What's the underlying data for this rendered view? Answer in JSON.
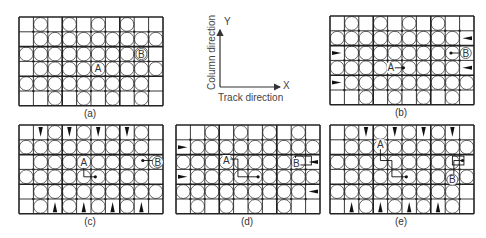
{
  "figure": {
    "panels": [
      {
        "id": "a",
        "label": "(a)",
        "x": 18,
        "y": 16,
        "labelY": 108,
        "grid": [
          [
            "E",
            "C",
            "E",
            "C",
            "E",
            "C",
            "E",
            "C",
            "E",
            "E"
          ],
          [
            "E",
            "C",
            "C",
            "C",
            "C",
            "C",
            "C",
            "C",
            "C",
            "C"
          ],
          [
            "C",
            "C",
            "C",
            "C",
            "C",
            "C",
            "C",
            "C",
            "C",
            "E"
          ],
          [
            "E",
            "C",
            "C",
            "C",
            "C",
            "C",
            "C",
            "C",
            "C",
            "C"
          ],
          [
            "C",
            "C",
            "C",
            "C",
            "C",
            "C",
            "C",
            "C",
            "C",
            "E"
          ],
          [
            "E",
            "E",
            "C",
            "E",
            "C",
            "E",
            "C",
            "E",
            "C",
            "E"
          ]
        ],
        "markers": [
          {
            "text": "A",
            "row": 3,
            "col": 5,
            "dx": 0,
            "dy": 0,
            "circled": false
          },
          {
            "text": "B",
            "row": 2,
            "col": 8,
            "dx": 0,
            "dy": 0,
            "circled": true
          }
        ],
        "paths": []
      },
      {
        "id": "b",
        "label": "(b)",
        "x": 329,
        "y": 15,
        "labelY": 107,
        "grid": [
          [
            "E",
            "C",
            "E",
            "C",
            "E",
            "C",
            "E",
            "C",
            "E",
            "E"
          ],
          [
            "C",
            "C",
            "C",
            "C",
            "C",
            "C",
            "C",
            "C",
            "C",
            "L"
          ],
          [
            "R",
            "C",
            "C",
            "C",
            "C",
            "C",
            "C",
            "C",
            "C",
            "E"
          ],
          [
            "C",
            "C",
            "C",
            "C",
            "C",
            "C",
            "C",
            "C",
            "C",
            "L"
          ],
          [
            "R",
            "C",
            "C",
            "C",
            "C",
            "C",
            "C",
            "C",
            "C",
            "C"
          ],
          [
            "E",
            "E",
            "C",
            "E",
            "C",
            "E",
            "C",
            "E",
            "C",
            "E"
          ]
        ],
        "markers": [
          {
            "text": "A",
            "row": 3,
            "col": 4,
            "dx": -4,
            "dy": 0,
            "circled": false
          },
          {
            "text": "B",
            "row": 2,
            "col": 9,
            "dx": -1,
            "dy": 0,
            "circled": true
          }
        ],
        "paths": [
          {
            "points": [
              [
                4.4,
                3.5
              ],
              [
                5.1,
                3.5
              ]
            ],
            "dot": true
          },
          {
            "points": [
              [
                8.4,
                2.5
              ],
              [
                9.0,
                2.5
              ]
            ],
            "dot": "start"
          }
        ]
      },
      {
        "id": "c",
        "label": "(c)",
        "x": 18,
        "y": 124,
        "labelY": 216,
        "grid": [
          [
            "E",
            "D",
            "C",
            "D",
            "C",
            "D",
            "C",
            "D",
            "C",
            "E"
          ],
          [
            "C",
            "C",
            "C",
            "C",
            "C",
            "C",
            "C",
            "C",
            "C",
            "E"
          ],
          [
            "E",
            "C",
            "C",
            "C",
            "C",
            "C",
            "C",
            "C",
            "C",
            "C"
          ],
          [
            "C",
            "C",
            "C",
            "C",
            "C",
            "C",
            "C",
            "C",
            "C",
            "E"
          ],
          [
            "E",
            "C",
            "C",
            "C",
            "C",
            "C",
            "C",
            "C",
            "C",
            "C"
          ],
          [
            "E",
            "C",
            "U",
            "C",
            "U",
            "C",
            "U",
            "C",
            "U",
            "E"
          ]
        ],
        "markers": [
          {
            "text": "A",
            "row": 2,
            "col": 4,
            "dx": 0,
            "dy": 0,
            "circled": false
          },
          {
            "text": "B",
            "row": 2,
            "col": 9,
            "dx": 2,
            "dy": 0,
            "circled": true
          }
        ],
        "paths": [
          {
            "points": [
              [
                4.5,
                2.9
              ],
              [
                4.5,
                3.5
              ],
              [
                5.3,
                3.5
              ]
            ],
            "dot": true
          },
          {
            "points": [
              [
                8.6,
                2.4
              ],
              [
                9.3,
                2.4
              ]
            ],
            "dot": "start"
          }
        ]
      },
      {
        "id": "d",
        "label": "(d)",
        "x": 175,
        "y": 124,
        "labelY": 216,
        "grid": [
          [
            "E",
            "E",
            "C",
            "E",
            "C",
            "E",
            "C",
            "E",
            "C",
            "E"
          ],
          [
            "R",
            "C",
            "C",
            "C",
            "C",
            "C",
            "C",
            "C",
            "C",
            "C"
          ],
          [
            "C",
            "C",
            "C",
            "C",
            "C",
            "C",
            "C",
            "C",
            "C",
            "L"
          ],
          [
            "R",
            "C",
            "C",
            "C",
            "C",
            "C",
            "C",
            "C",
            "C",
            "C"
          ],
          [
            "C",
            "C",
            "C",
            "C",
            "C",
            "C",
            "C",
            "C",
            "C",
            "L"
          ],
          [
            "E",
            "C",
            "E",
            "C",
            "E",
            "C",
            "E",
            "C",
            "E",
            "E"
          ]
        ],
        "markers": [
          {
            "text": "A",
            "row": 2,
            "col": 3,
            "dx": 0,
            "dy": -2,
            "circled": false
          },
          {
            "text": "B",
            "row": 2,
            "col": 8,
            "dx": -2,
            "dy": 1,
            "circled": false
          }
        ],
        "paths": [
          {
            "points": [
              [
                3.4,
                2.3
              ],
              [
                4.3,
                2.3
              ],
              [
                4.3,
                3.5
              ],
              [
                5.7,
                3.5
              ]
            ],
            "dot": true
          }
        ],
        "boxes": [
          {
            "row": 2,
            "col": 8,
            "w": 1.1,
            "h": 0.6,
            "dx": 0.3,
            "dy": 0.1
          }
        ]
      },
      {
        "id": "e",
        "label": "(e)",
        "x": 329,
        "y": 124,
        "labelY": 216,
        "grid": [
          [
            "E",
            "C",
            "D",
            "C",
            "D",
            "C",
            "D",
            "C",
            "D",
            "E"
          ],
          [
            "E",
            "C",
            "C",
            "C",
            "C",
            "C",
            "C",
            "C",
            "C",
            "C"
          ],
          [
            "C",
            "C",
            "C",
            "C",
            "C",
            "C",
            "C",
            "C",
            "C",
            "E"
          ],
          [
            "E",
            "C",
            "C",
            "C",
            "C",
            "C",
            "C",
            "C",
            "C",
            "C"
          ],
          [
            "C",
            "C",
            "C",
            "C",
            "C",
            "C",
            "C",
            "C",
            "C",
            "E"
          ],
          [
            "E",
            "U",
            "C",
            "U",
            "C",
            "U",
            "C",
            "U",
            "C",
            "E"
          ]
        ],
        "markers": [
          {
            "text": "A",
            "row": 1,
            "col": 3,
            "dx": 0,
            "dy": -3,
            "circled": false
          },
          {
            "text": "B",
            "row": 3,
            "col": 8,
            "dx": 0,
            "dy": 3,
            "circled": true
          }
        ],
        "paths": [
          {
            "points": [
              [
                3.5,
                1.5
              ],
              [
                3.5,
                2.4
              ],
              [
                4.3,
                2.4
              ],
              [
                4.3,
                3.5
              ],
              [
                5.3,
                3.5
              ]
            ],
            "dot": true
          },
          {
            "points": [
              [
                8.6,
                3.3
              ],
              [
                8.6,
                2.4
              ],
              [
                9.2,
                2.4
              ]
            ],
            "dot": "end"
          }
        ],
        "boxes": [
          {
            "row": 2,
            "col": 8,
            "w": 0.8,
            "h": 0.6,
            "dx": 0.5,
            "dy": 0.1
          }
        ]
      }
    ],
    "axes": {
      "y_label": "Y",
      "x_label": "X",
      "vertical_caption": "Column direction",
      "horizontal_caption": "Track direction"
    },
    "colors": {
      "grid_line": "#222222",
      "circle_fill": "#ffffff",
      "circle_stroke": "#444444",
      "arrow": "#111111",
      "text": "#333333"
    }
  }
}
